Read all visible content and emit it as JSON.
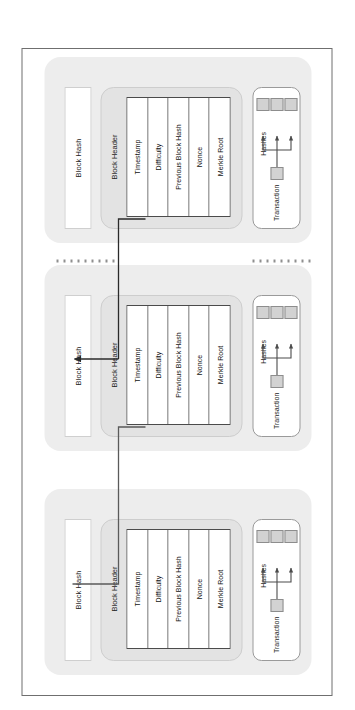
{
  "figure": {
    "caption": "FIGURE 1-3   The structure of a blockchain",
    "colors": {
      "block_fill": "#ededed",
      "header_fill": "#e3e3e3",
      "field_fill": "#ffffff",
      "node_fill": "#d2d2d2",
      "line": "#4b4b4b",
      "frame_border": "#6f6f6f"
    }
  },
  "blocks": [
    {
      "id": "block-1",
      "block_hash_label": "Block Hash",
      "block_header_label": "Block Header",
      "fields": [
        "Timestamp",
        "Difficulty",
        "Previous Block Hash",
        "Nonce",
        "Merkle Root"
      ],
      "transaction_label": "Transaction",
      "hashes_label": "Hashes",
      "tx_nodes": [
        "root",
        "leaf-a",
        "leaf-b",
        "leaf-c"
      ]
    },
    {
      "id": "block-2",
      "block_hash_label": "Block Hash",
      "block_header_label": "Block Header",
      "fields": [
        "Timestamp",
        "Difficulty",
        "Previous Block Hash",
        "Nonce",
        "Merkle Root"
      ],
      "transaction_label": "Transaction",
      "hashes_label": "Hashes",
      "tx_nodes": [
        "root",
        "leaf-a",
        "leaf-b",
        "leaf-c"
      ]
    },
    {
      "id": "block-3",
      "block_hash_label": "Block Hash",
      "block_header_label": "Block Header",
      "fields": [
        "Timestamp",
        "Difficulty",
        "Previous Block Hash",
        "Nonce",
        "Merkle Root"
      ],
      "transaction_label": "Transaction",
      "hashes_label": "Hashes",
      "tx_nodes": [
        "root",
        "leaf-a",
        "leaf-b",
        "leaf-c"
      ]
    }
  ],
  "connectors": {
    "ellipsis_count": 2,
    "chain_arrows": 2,
    "description": "Previous Block Hash field of each block points back to the Block Hash of the preceding block"
  }
}
